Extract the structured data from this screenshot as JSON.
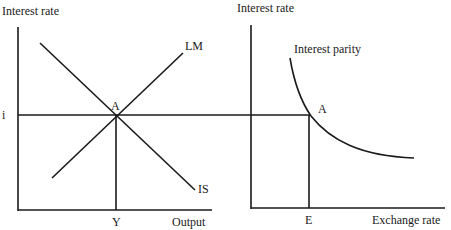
{
  "left_panel": {
    "y_axis_label": "Interest rate",
    "x_axis_label": "Output",
    "interest_level_label": "i",
    "equilibrium_label": "A",
    "output_level_label": "Y",
    "curves": [
      {
        "name": "IS",
        "label": "IS",
        "slope": "downward"
      },
      {
        "name": "LM",
        "label": "LM",
        "slope": "upward"
      }
    ]
  },
  "right_panel": {
    "y_axis_label": "Interest rate",
    "x_axis_label": "Exchange rate",
    "equilibrium_label": "A",
    "exchange_level_label": "E",
    "curves": [
      {
        "name": "Interest parity",
        "label": "Interest parity",
        "slope": "downward convex"
      }
    ]
  },
  "colors": {
    "background": "#ffffff",
    "ink": "#1a1a1a"
  }
}
